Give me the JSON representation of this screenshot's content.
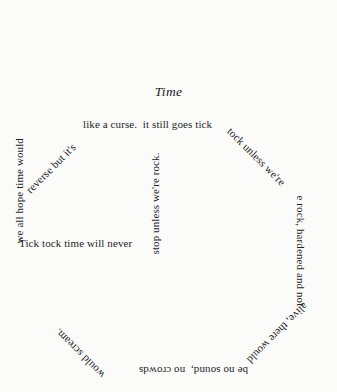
{
  "page": {
    "background_color": "#fbfbfa",
    "text_color": "#1f1f1f",
    "shape": "octagon",
    "form": "concrete-poem"
  },
  "title": "Time",
  "poem": {
    "full_text": "Tick tock time will never stop unless we're rock. it still goes tick tock unless we're rock, hardened and not alive, there would be no sound, no crowds would scream. we all hope time would reverse but it's like a curse.",
    "segments": [
      {
        "id": "left-horizontal",
        "text": "Tick tock time will never",
        "orientation": "horizontal"
      },
      {
        "id": "inner-vertical",
        "text": "stop unless we're rock.",
        "orientation": "vertical-up"
      },
      {
        "id": "top-horizontal",
        "text": "like a curse.  it still goes tick",
        "orientation": "horizontal"
      },
      {
        "id": "upper-right-diagonal",
        "text": "tock unless we're",
        "orientation": "diagonal-down-right"
      },
      {
        "id": "right-vertical",
        "text": "e rock, hardened and not",
        "orientation": "vertical-down"
      },
      {
        "id": "lower-right-diagonal",
        "text": "alive, there would",
        "orientation": "diagonal-down-left"
      },
      {
        "id": "bottom-horizontal",
        "text": "be no sound,  no crowds",
        "orientation": "horizontal-inverted"
      },
      {
        "id": "lower-left-diagonal",
        "text": "would scream.",
        "orientation": "diagonal-up-left"
      },
      {
        "id": "left-vertical",
        "text": "we all hope time would",
        "orientation": "vertical-up"
      },
      {
        "id": "upper-left-diagonal",
        "text": "reverse but it's",
        "orientation": "diagonal-up-right"
      }
    ]
  }
}
